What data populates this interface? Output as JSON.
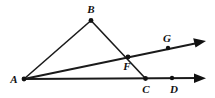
{
  "figure": {
    "type": "geometry-diagram",
    "background_color": "#ffffff",
    "stroke_color": "#1a1a1a",
    "label_color": "#111111",
    "canvas": {
      "width": 215,
      "height": 98
    },
    "points": [
      {
        "id": "A",
        "label": "A",
        "x": 24,
        "y": 79,
        "label_x": 14,
        "label_y": 83,
        "dot": true
      },
      {
        "id": "B",
        "label": "B",
        "x": 91,
        "y": 20,
        "label_x": 91,
        "label_y": 13,
        "dot": true
      },
      {
        "id": "F",
        "label": "F",
        "x": 128,
        "y": 57,
        "label_x": 127,
        "label_y": 70,
        "dot": true
      },
      {
        "id": "G",
        "label": "G",
        "x": 168,
        "y": 48,
        "label_x": 167,
        "label_y": 42,
        "dot": true
      },
      {
        "id": "C",
        "label": "C",
        "x": 145,
        "y": 78,
        "label_x": 146,
        "label_y": 93,
        "dot": true
      },
      {
        "id": "D",
        "label": "D",
        "x": 172,
        "y": 78,
        "label_x": 174,
        "label_y": 93,
        "dot": true
      }
    ],
    "segments": [
      {
        "id": "AB",
        "from": "A",
        "to": "B",
        "x1": 24,
        "y1": 79,
        "x2": 91,
        "y2": 20,
        "width": 1.6
      },
      {
        "id": "BC",
        "from": "B",
        "to": "C",
        "x1": 91,
        "y1": 20,
        "x2": 145,
        "y2": 78,
        "width": 1.6
      }
    ],
    "rays": [
      {
        "id": "AG",
        "from": "A",
        "through": "G",
        "x1": 24,
        "y1": 79,
        "x2": 200,
        "y2": 42,
        "width": 1.8,
        "arrow": true
      },
      {
        "id": "AD",
        "from": "A",
        "through": "D",
        "x1": 24,
        "y1": 79,
        "x2": 200,
        "y2": 78,
        "width": 1.8,
        "arrow": true
      }
    ],
    "arrowheads": [
      {
        "id": "arrow-AG",
        "tip_x": 206,
        "tip_y": 41,
        "angle": -11.9
      },
      {
        "id": "arrow-AD",
        "tip_x": 206,
        "tip_y": 78,
        "angle": 0
      }
    ],
    "labels": {
      "A": "A",
      "B": "B",
      "C": "C",
      "D": "D",
      "F": "F",
      "G": "G"
    }
  }
}
